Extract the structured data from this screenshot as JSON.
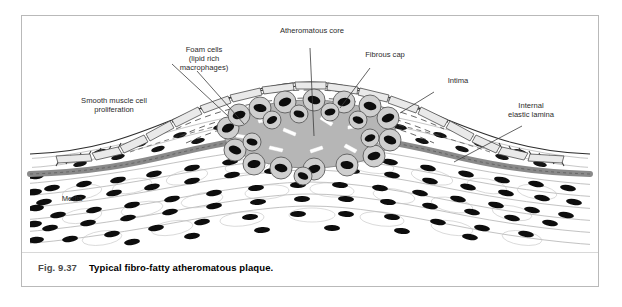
{
  "figure": {
    "number": "Fig. 9.37",
    "caption": "Typical fibro-fatty atheromatous plaque.",
    "type": "medical-illustration"
  },
  "labels": [
    {
      "id": "foam-cells",
      "line1": "Foam cells",
      "line2": "(lipid rich",
      "line3": "macrophages)"
    },
    {
      "id": "atheromatous-core",
      "line1": "Atheromatous core"
    },
    {
      "id": "fibrous-cap",
      "line1": "Fibrous cap"
    },
    {
      "id": "intima",
      "line1": "Intima"
    },
    {
      "id": "internal-elastic-lamina",
      "line1": "Internal",
      "line2": "elastic lamina"
    },
    {
      "id": "smooth-muscle",
      "line1": "Smooth muscle cell",
      "line2": "proliferation"
    },
    {
      "id": "media",
      "line1": "Media"
    }
  ],
  "colors": {
    "frame": "#b9b9b9",
    "ink": "#1a1a1a",
    "label_text": "#2b2b2b",
    "fignum": "#4a4a4a",
    "lipid_core": "#b6b6b6",
    "foam_cytoplasm": "#d2d2d2",
    "nucleus": "#101010",
    "elastic_lamina": "#8a8a8a",
    "endothelium_fill": "#e8e8e8",
    "background": "#ffffff"
  }
}
